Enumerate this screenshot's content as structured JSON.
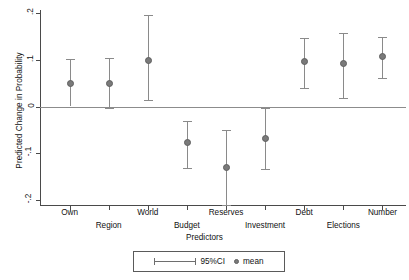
{
  "chart_data": {
    "type": "scatter",
    "title": "",
    "xlabel": "Predictors",
    "ylabel": "Predicted Change in Probability",
    "ylim": [
      -0.2,
      0.2
    ],
    "yticks": [
      0.2,
      0.1,
      0,
      -0.1,
      -0.2
    ],
    "ytick_labels": [
      ".2",
      ".1",
      "0",
      "-.1",
      "-.2"
    ],
    "grid": false,
    "zero_reference_line": 0,
    "legend_position": "bottom-center",
    "legend": [
      {
        "key": "ci",
        "label": "95%CI",
        "marker": "errorbar"
      },
      {
        "key": "mean",
        "label": "mean",
        "marker": "dot"
      }
    ],
    "categories": [
      "Own",
      "Region",
      "World",
      "Budget",
      "Reserves",
      "Investment",
      "Debt",
      "Elections",
      "Number"
    ],
    "series": [
      {
        "name": "mean",
        "values": [
          0.051,
          0.051,
          0.1,
          -0.077,
          -0.13,
          -0.068,
          0.098,
          0.092,
          0.109
        ]
      },
      {
        "name": "95%CI lower",
        "values": [
          0.0,
          -0.004,
          0.013,
          -0.132,
          -0.211,
          -0.134,
          0.04,
          0.019,
          0.06
        ]
      },
      {
        "name": "95%CI upper",
        "values": [
          0.102,
          0.104,
          0.196,
          -0.032,
          -0.051,
          -0.004,
          0.147,
          0.158,
          0.149
        ]
      }
    ],
    "points": [
      {
        "category": "Own",
        "mean": 0.051,
        "ci_low": 0.0,
        "ci_high": 0.102,
        "label_row": 0
      },
      {
        "category": "Region",
        "mean": 0.051,
        "ci_low": -0.004,
        "ci_high": 0.104,
        "label_row": 1
      },
      {
        "category": "World",
        "mean": 0.1,
        "ci_low": 0.013,
        "ci_high": 0.196,
        "label_row": 0
      },
      {
        "category": "Budget",
        "mean": -0.077,
        "ci_low": -0.132,
        "ci_high": -0.032,
        "label_row": 1
      },
      {
        "category": "Reserves",
        "mean": -0.13,
        "ci_low": -0.211,
        "ci_high": -0.051,
        "label_row": 0
      },
      {
        "category": "Investment",
        "mean": -0.068,
        "ci_low": -0.134,
        "ci_high": -0.004,
        "label_row": 1
      },
      {
        "category": "Debt",
        "mean": 0.098,
        "ci_low": 0.04,
        "ci_high": 0.147,
        "label_row": 0
      },
      {
        "category": "Elections",
        "mean": 0.092,
        "ci_low": 0.019,
        "ci_high": 0.158,
        "label_row": 1
      },
      {
        "category": "Number",
        "mean": 0.109,
        "ci_low": 0.06,
        "ci_high": 0.149,
        "label_row": 0
      }
    ],
    "colors": {
      "axis": "#4a4a4a",
      "zero_line": "#8c8c8c",
      "marker": "#7a7a7a",
      "error_bar": "#8a8a8a",
      "text": "#111111",
      "background": "#ffffff"
    }
  }
}
